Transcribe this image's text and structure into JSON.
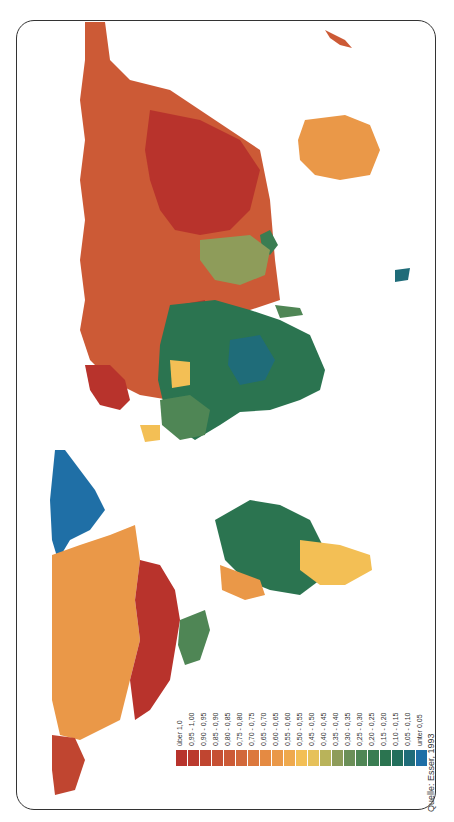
{
  "map": {
    "orientation": "rotated 90° clockwise (north to the right)",
    "source": "Quelle: Esser, 1993",
    "legend": [
      {
        "label": "über 1,0",
        "color": "#b8332c"
      },
      {
        "label": "0,95 - 1,00",
        "color": "#bb3a2e"
      },
      {
        "label": "0,90 - 0,95",
        "color": "#c04530"
      },
      {
        "label": "0,85 - 0,90",
        "color": "#c65033"
      },
      {
        "label": "0,80 - 0,85",
        "color": "#cc5a36"
      },
      {
        "label": "0,75 - 0,80",
        "color": "#d2683a"
      },
      {
        "label": "0,70 - 0,75",
        "color": "#dc783d"
      },
      {
        "label": "0,65 - 0,70",
        "color": "#e58a42"
      },
      {
        "label": "0,60 - 0,65",
        "color": "#ea9848"
      },
      {
        "label": "0,55 - 0,60",
        "color": "#efa94d"
      },
      {
        "label": "0,50 - 0,55",
        "color": "#f3bf55"
      },
      {
        "label": "0,45 - 0,50",
        "color": "#e6c15a"
      },
      {
        "label": "0,40 - 0,45",
        "color": "#b9b35a"
      },
      {
        "label": "0,35 - 0,40",
        "color": "#8e9c5a"
      },
      {
        "label": "0,30 - 0,35",
        "color": "#6b8f58"
      },
      {
        "label": "0,25 - 0,30",
        "color": "#4f8655"
      },
      {
        "label": "0,20 - 0,25",
        "color": "#3a7d52"
      },
      {
        "label": "0,15 - 0,20",
        "color": "#2b7450"
      },
      {
        "label": "0,10 - 0,15",
        "color": "#226f5c"
      },
      {
        "label": "0,05 - 0,10",
        "color": "#1f6c79"
      },
      {
        "label": "unter 0,05",
        "color": "#1f6fa6"
      }
    ]
  }
}
